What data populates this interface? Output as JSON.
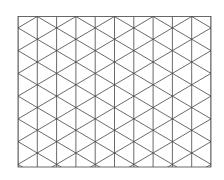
{
  "diagram": {
    "type": "isometric-triangle-grid",
    "background": "#ffffff",
    "line_color": "#444444",
    "line_width": 0.8,
    "border": {
      "x": 18,
      "y": 16.5,
      "width": 193,
      "height": 150.5
    },
    "columns": 10,
    "column_spacing": 19.3,
    "row_period": 22.75,
    "odd_column_phase": 16.5
  }
}
